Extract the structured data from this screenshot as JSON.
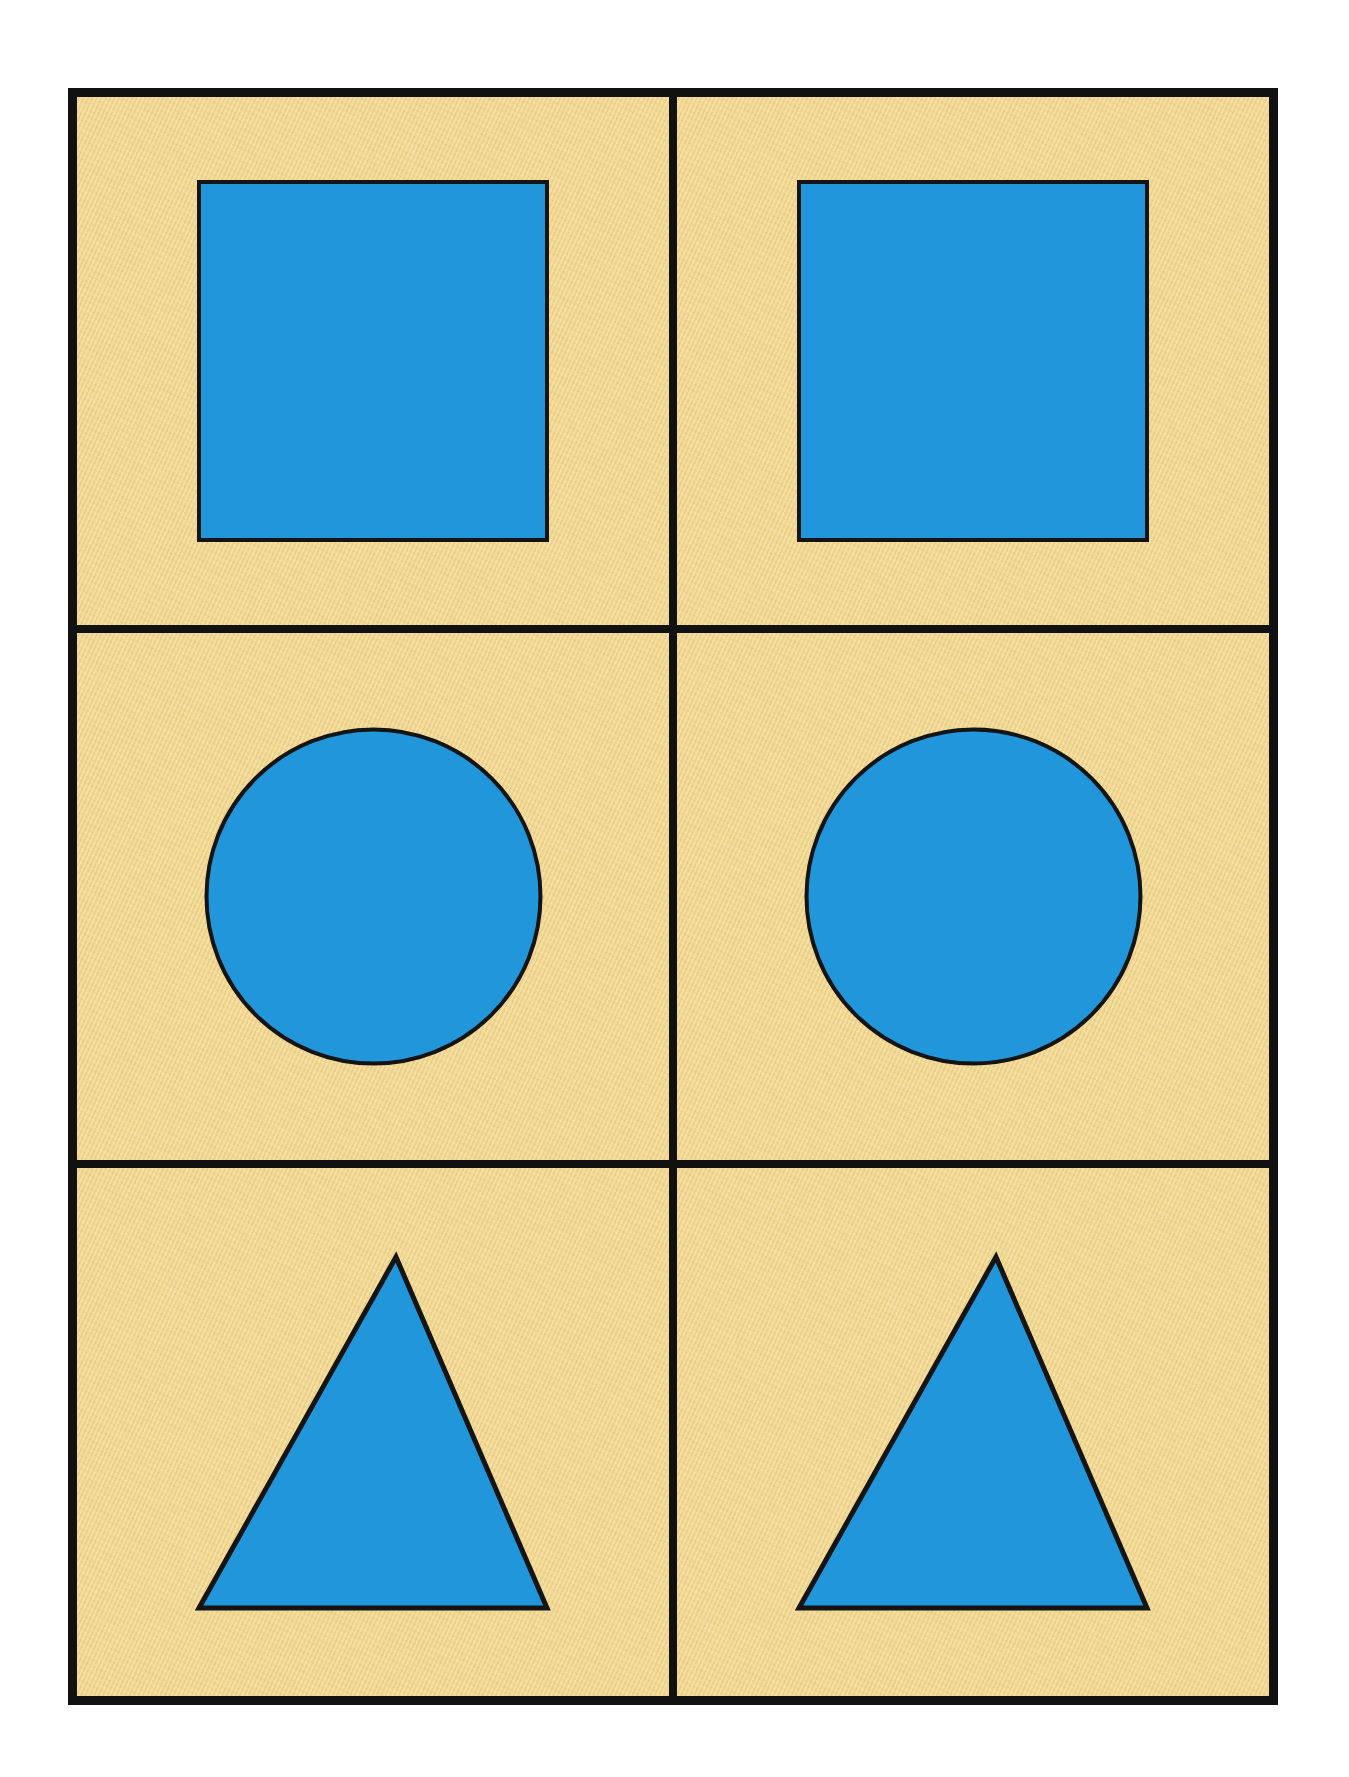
{
  "page": {
    "background_color": "#ffffff",
    "frame_color": "#111111",
    "cell_background_color": "#f2d890",
    "shape_fill_color": "#2196db",
    "shape_outline_color": "#141414",
    "columns": 2,
    "rows": 3,
    "outer_border_px": 9,
    "divider_px": 8
  },
  "grid": {
    "cells": [
      {
        "id": "cell-r1c1",
        "row": 1,
        "column": 1,
        "shape": "square",
        "shape_label": "Blue Square",
        "fill": "#2196db",
        "stroke": "#141414",
        "width_px": 352,
        "height_px": 362
      },
      {
        "id": "cell-r1c2",
        "row": 1,
        "column": 2,
        "shape": "square",
        "shape_label": "Blue Square",
        "fill": "#2196db",
        "stroke": "#141414",
        "width_px": 352,
        "height_px": 362
      },
      {
        "id": "cell-r2c1",
        "row": 2,
        "column": 1,
        "shape": "circle",
        "shape_label": "Blue Circle",
        "fill": "#2196db",
        "stroke": "#141414",
        "width_px": 335,
        "height_px": 335
      },
      {
        "id": "cell-r2c2",
        "row": 2,
        "column": 2,
        "shape": "circle",
        "shape_label": "Blue Circle",
        "fill": "#2196db",
        "stroke": "#141414",
        "width_px": 335,
        "height_px": 335
      },
      {
        "id": "cell-r3c1",
        "row": 3,
        "column": 1,
        "shape": "triangle",
        "shape_label": "Blue Triangle",
        "fill": "#2196db",
        "stroke": "#141414",
        "width_px": 350,
        "height_px": 353
      },
      {
        "id": "cell-r3c2",
        "row": 3,
        "column": 2,
        "shape": "triangle",
        "shape_label": "Blue Triangle",
        "fill": "#2196db",
        "stroke": "#141414",
        "width_px": 350,
        "height_px": 353
      }
    ]
  }
}
